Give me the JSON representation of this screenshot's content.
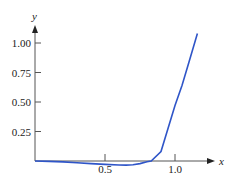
{
  "chart_data": {
    "type": "line",
    "title": "",
    "xlabel": "x",
    "ylabel": "y",
    "xlim": [
      0,
      1.28
    ],
    "ylim": [
      -0.05,
      1.12
    ],
    "grid": false,
    "legend": null,
    "x_ticks": [
      {
        "value": 0.5,
        "label": "0.5"
      },
      {
        "value": 1.0,
        "label": "1.0"
      }
    ],
    "y_ticks": [
      {
        "value": 0.25,
        "label": "0.25"
      },
      {
        "value": 0.5,
        "label": "0.50"
      },
      {
        "value": 0.75,
        "label": "0.75"
      },
      {
        "value": 1.0,
        "label": "1.00"
      }
    ],
    "series": [
      {
        "name": "curve",
        "color": "#2f55c8",
        "x": [
          0,
          0.1,
          0.2,
          0.3,
          0.4,
          0.5,
          0.6,
          0.65,
          0.7,
          0.75,
          0.8,
          0.83,
          0.9,
          1.0,
          1.05,
          1.1,
          1.16
        ],
        "y": [
          0,
          -0.003,
          -0.008,
          -0.014,
          -0.022,
          -0.029,
          -0.034,
          -0.035,
          -0.032,
          -0.022,
          -0.006,
          0.0,
          0.08,
          0.47,
          0.64,
          0.84,
          1.08
        ]
      }
    ]
  }
}
